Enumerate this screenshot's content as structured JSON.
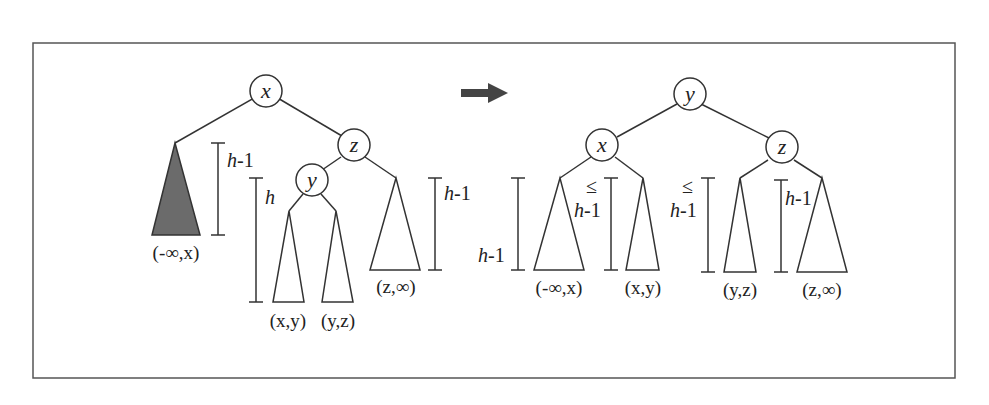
{
  "diagram": {
    "arrow": "transform-arrow",
    "before": {
      "nodes": [
        {
          "id": "x",
          "label": "x"
        },
        {
          "id": "z",
          "label": "z"
        },
        {
          "id": "y",
          "label": "y"
        }
      ],
      "subtrees": [
        {
          "label": "(-∞,x)",
          "shaded": true
        },
        {
          "label": "(x,y)",
          "shaded": false
        },
        {
          "label": "(y,z)",
          "shaded": false
        },
        {
          "label": "(z,∞)",
          "shaded": false
        }
      ],
      "heights": [
        {
          "label": "h-1",
          "for": "(-∞,x)"
        },
        {
          "label": "h",
          "for": "y-subtree"
        },
        {
          "label": "h-1",
          "for": "(z,∞)"
        }
      ]
    },
    "after": {
      "nodes": [
        {
          "id": "y",
          "label": "y"
        },
        {
          "id": "x",
          "label": "x"
        },
        {
          "id": "z",
          "label": "z"
        }
      ],
      "subtrees": [
        {
          "label": "(-∞,x)"
        },
        {
          "label": "(x,y)"
        },
        {
          "label": "(y,z)"
        },
        {
          "label": "(z,∞)"
        }
      ],
      "heights": [
        {
          "label": "h-1",
          "prefix": ""
        },
        {
          "label": "h-1",
          "prefix": "≤"
        },
        {
          "label": "h-1",
          "prefix": "≤"
        },
        {
          "label": "h-1",
          "prefix": ""
        }
      ]
    }
  }
}
